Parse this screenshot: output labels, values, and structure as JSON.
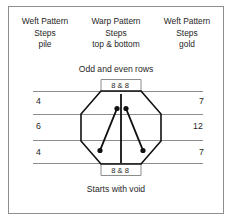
{
  "figure": {
    "columns": [
      {
        "name": "weft-pattern-pile",
        "line1": "Weft Pattern",
        "line2": "Steps",
        "line3": "pile"
      },
      {
        "name": "warp-pattern-top-bottom",
        "line1": "Warp Pattern",
        "line2": "Steps",
        "line3": "top & bottom"
      },
      {
        "name": "weft-pattern-gold",
        "line1": "Weft Pattern",
        "line2": "Steps",
        "line3": "gold"
      }
    ],
    "caption_top": "Odd and even rows",
    "caption_bottom": "Starts with void",
    "band_top_label": "8 & 8",
    "band_bottom_label": "8 & 8",
    "left_steps": [
      "4",
      "6",
      "4"
    ],
    "right_steps": [
      "7",
      "12",
      "7"
    ],
    "colors": {
      "line": "#8d8d8d",
      "shape": "#111111",
      "text": "#1f1f1f",
      "background": "#ffffff"
    }
  }
}
